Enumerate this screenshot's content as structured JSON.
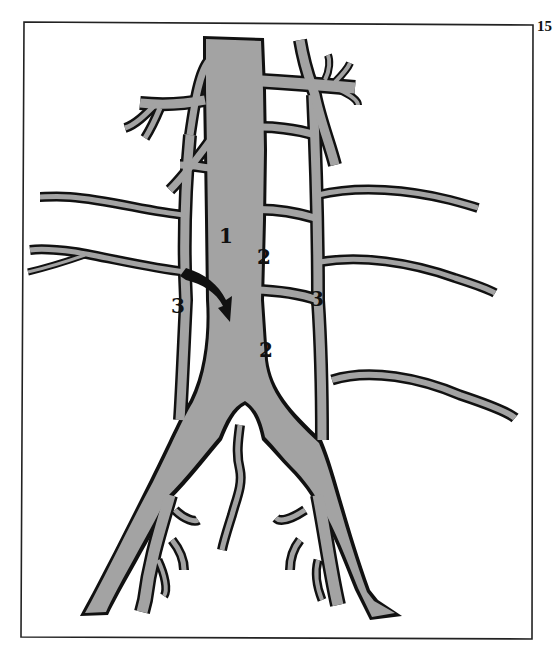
{
  "page_number": "15",
  "figure": {
    "type": "vascular-anatomy-diagram",
    "vessel_color": "#a3a3a3",
    "outline_color": "#111111",
    "labels": [
      {
        "id": "label-1",
        "text": "1"
      },
      {
        "id": "label-2-upper",
        "text": "2"
      },
      {
        "id": "label-2-lower",
        "text": "2"
      },
      {
        "id": "label-3-left",
        "text": "3"
      },
      {
        "id": "label-3-right",
        "text": "3"
      }
    ],
    "arrow": {
      "description": "curved arrow from left lateral vessel into central trunk"
    }
  }
}
